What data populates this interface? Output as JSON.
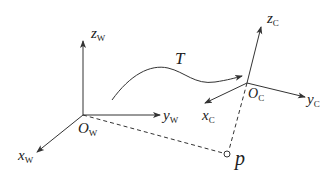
{
  "diagram": {
    "colors": {
      "stroke": "#333333",
      "background": "#ffffff"
    },
    "world_frame": {
      "origin_label": "O",
      "origin_sub": "W",
      "axes": [
        {
          "name": "z",
          "sub": "W"
        },
        {
          "name": "y",
          "sub": "W"
        },
        {
          "name": "x",
          "sub": "W"
        }
      ]
    },
    "camera_frame": {
      "origin_label": "O",
      "origin_sub": "C",
      "axes": [
        {
          "name": "z",
          "sub": "C"
        },
        {
          "name": "y",
          "sub": "C"
        },
        {
          "name": "x",
          "sub": "C"
        }
      ]
    },
    "transform_label": "T",
    "point_label": "p"
  }
}
